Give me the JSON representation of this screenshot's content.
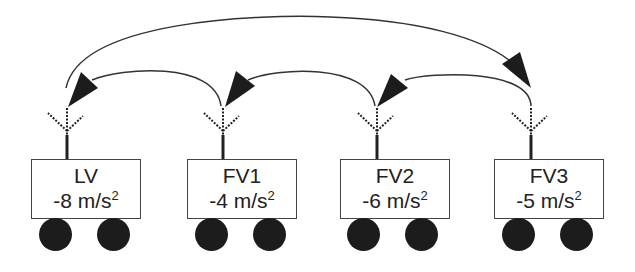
{
  "diagram": {
    "type": "platoon-communication",
    "colors": {
      "stroke": "#333333",
      "fill": "#1c1c1c",
      "box_border": "#444444"
    },
    "vehicles": [
      {
        "id": "LV",
        "label": "LV",
        "accel_value": "-8",
        "accel_unit": "m/s",
        "accel_exp": "2",
        "x": 31,
        "antenna_x": 67
      },
      {
        "id": "FV1",
        "label": "FV1",
        "accel_value": "-4",
        "accel_unit": "m/s",
        "accel_exp": "2",
        "x": 187,
        "antenna_x": 223
      },
      {
        "id": "FV2",
        "label": "FV2",
        "accel_value": "-6",
        "accel_unit": "m/s",
        "accel_exp": "2",
        "x": 340,
        "antenna_x": 377
      },
      {
        "id": "FV3",
        "label": "FV3",
        "accel_value": "-5",
        "accel_unit": "m/s",
        "accel_exp": "2",
        "x": 494,
        "antenna_x": 531
      }
    ],
    "links": [
      {
        "from": "FV1",
        "to": "LV"
      },
      {
        "from": "FV2",
        "to": "FV1"
      },
      {
        "from": "FV3",
        "to": "FV2"
      },
      {
        "from": "LV",
        "to": "FV3"
      }
    ]
  }
}
